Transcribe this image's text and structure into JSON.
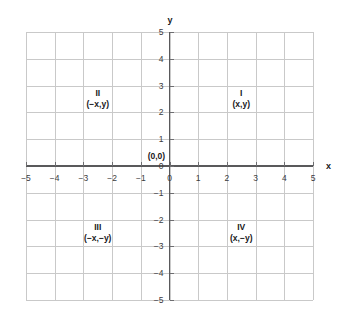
{
  "chart_data": {
    "type": "diagram",
    "title": "",
    "subtitle": "",
    "xlabel": "x",
    "ylabel": "y",
    "xlim": [
      -5,
      5
    ],
    "ylim": [
      -5,
      5
    ],
    "grid": true,
    "grid_step": 1,
    "legend": "none",
    "x_ticks": [
      "−5",
      "−4",
      "−3",
      "−2",
      "−1",
      "0",
      "1",
      "2",
      "3",
      "4",
      "5"
    ],
    "x_tick_values": [
      -5,
      -4,
      -3,
      -2,
      -1,
      0,
      1,
      2,
      3,
      4,
      5
    ],
    "y_ticks": [
      "5",
      "4",
      "3",
      "2",
      "1",
      "0",
      "−1",
      "−2",
      "−3",
      "−4",
      "−5"
    ],
    "y_tick_values": [
      5,
      4,
      3,
      2,
      1,
      0,
      -1,
      -2,
      -3,
      -4,
      -5
    ],
    "annotations": [
      {
        "name": "origin",
        "text": "(0,0)",
        "x": -0.15,
        "y": 0.35
      },
      {
        "name": "quadrant-1",
        "roman": "I",
        "coord": "(x,y)",
        "x": 2.5,
        "y": 2.5
      },
      {
        "name": "quadrant-2",
        "roman": "II",
        "coord": "(−x,y)",
        "x": -2.5,
        "y": 2.5
      },
      {
        "name": "quadrant-3",
        "roman": "III",
        "coord": "(−x,−y)",
        "x": -2.5,
        "y": -2.5
      },
      {
        "name": "quadrant-4",
        "roman": "IV",
        "coord": "(x,−y)",
        "x": 2.5,
        "y": -2.5
      }
    ],
    "colors": {
      "background": "#ffffff",
      "grid": "#c9c9c9",
      "axis": "#59595b",
      "text": "#19191b"
    }
  },
  "axis_labels": {
    "x": "x",
    "y": "y"
  },
  "quadrants": [
    {
      "roman": "I",
      "coord": "(x,y)"
    },
    {
      "roman": "II",
      "coord": "(−x,y)"
    },
    {
      "roman": "III",
      "coord": "(−x,−y)"
    },
    {
      "roman": "IV",
      "coord": "(x,−y)"
    }
  ],
  "origin": {
    "label": "(0,0)"
  },
  "ticks": {
    "x": [
      "−5",
      "−4",
      "−3",
      "−2",
      "−1",
      "0",
      "1",
      "2",
      "3",
      "4",
      "5"
    ],
    "y": [
      "5",
      "4",
      "3",
      "2",
      "1",
      "0",
      "−1",
      "−2",
      "−3",
      "−4",
      "−5"
    ]
  }
}
